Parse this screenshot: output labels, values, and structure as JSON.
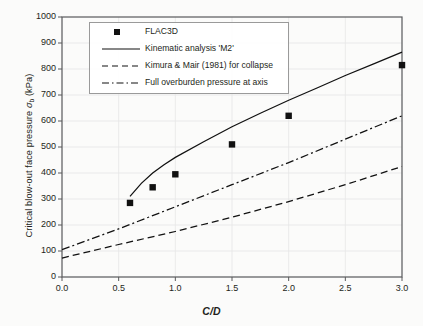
{
  "chart_data": {
    "type": "scatter",
    "title": "",
    "xlabel": "C/D",
    "ylabel": "Critical blow-out face pressure σb (kPa)",
    "xlim": [
      0.0,
      3.0
    ],
    "ylim": [
      0,
      1000
    ],
    "xticks": [
      "0.0",
      "0.5",
      "1.0",
      "1.5",
      "2.0",
      "2.5",
      "3.0"
    ],
    "yticks": [
      "0",
      "100",
      "200",
      "300",
      "400",
      "500",
      "600",
      "700",
      "800",
      "900",
      "1000"
    ],
    "grid": true,
    "legend_position": "upper-left-inside",
    "series": [
      {
        "name": "FLAC3D",
        "style": "scatter-square",
        "x": [
          0.6,
          0.8,
          1.0,
          1.5,
          2.0,
          3.0
        ],
        "values": [
          285,
          345,
          395,
          510,
          620,
          815
        ]
      },
      {
        "name": "Kinematic analysis 'M2'",
        "style": "solid-line",
        "x": [
          0.6,
          0.7,
          0.8,
          0.9,
          1.0,
          1.25,
          1.5,
          1.75,
          2.0,
          2.25,
          2.5,
          2.75,
          3.0
        ],
        "values": [
          310,
          360,
          400,
          432,
          460,
          520,
          578,
          630,
          680,
          727,
          775,
          820,
          865
        ]
      },
      {
        "name": "Kimura & Mair (1981) for collapse",
        "style": "dashed-line",
        "x": [
          0.0,
          0.5,
          1.0,
          1.5,
          2.0,
          2.5,
          3.0
        ],
        "values": [
          73,
          125,
          175,
          230,
          290,
          355,
          425
        ]
      },
      {
        "name": "Full overburden pressure at axis",
        "style": "dash-dot-line",
        "x": [
          0.0,
          0.5,
          1.0,
          1.5,
          2.0,
          2.5,
          3.0
        ],
        "values": [
          105,
          185,
          270,
          355,
          440,
          530,
          620
        ]
      }
    ]
  },
  "axis": {
    "y_label_main": "Critical blow-out face pressure ",
    "y_label_sigma": "σ",
    "y_label_sub": "b",
    "y_label_unit": " (kPa)",
    "x_label": "C/D"
  },
  "legend": {
    "items": [
      {
        "label": "FLAC3D",
        "key": "square-marker"
      },
      {
        "label": "Kinematic analysis 'M2'",
        "key": "solid-line"
      },
      {
        "label": "Kimura & Mair (1981) for collapse",
        "key": "dashed-line"
      },
      {
        "label": "Full overburden pressure at axis",
        "key": "dash-dot-line"
      }
    ]
  },
  "colors": {
    "axis": "#58595b",
    "grid": "#e6e6e6",
    "data": "#111111",
    "text": "#231f20"
  }
}
